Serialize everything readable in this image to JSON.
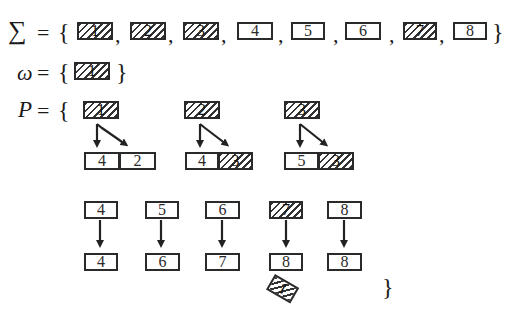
{
  "sigma_set": {
    "symbol": "∑",
    "equals": "=",
    "open_brace": "{",
    "close_brace": "}",
    "tiles": [
      {
        "label": "1",
        "hatched": true
      },
      {
        "label": "2",
        "hatched": true
      },
      {
        "label": "3",
        "hatched": true
      },
      {
        "label": "4",
        "hatched": false
      },
      {
        "label": "5",
        "hatched": false
      },
      {
        "label": "6",
        "hatched": false
      },
      {
        "label": "7",
        "hatched": true
      },
      {
        "label": "8",
        "hatched": false
      }
    ]
  },
  "omega_set": {
    "symbol": "ω",
    "equals": "=",
    "open_brace": "{",
    "close_brace": "}",
    "tiles": [
      {
        "label": "1",
        "hatched": true
      }
    ]
  },
  "productions": {
    "symbol": "P",
    "equals": "=",
    "open_brace": "{",
    "close_brace": "}",
    "rules": [
      {
        "lhs": {
          "label": "1",
          "hatched": true
        },
        "rhs": [
          {
            "label": "4",
            "hatched": false
          },
          {
            "label": "2",
            "hatched": false
          }
        ]
      },
      {
        "lhs": {
          "label": "2",
          "hatched": true
        },
        "rhs": [
          {
            "label": "4",
            "hatched": false
          },
          {
            "label": "3",
            "hatched": true
          }
        ]
      },
      {
        "lhs": {
          "label": "3",
          "hatched": true
        },
        "rhs": [
          {
            "label": "5",
            "hatched": false
          },
          {
            "label": "3",
            "hatched": true
          }
        ]
      },
      {
        "lhs": {
          "label": "4",
          "hatched": false
        },
        "rhs": [
          {
            "label": "4",
            "hatched": false
          }
        ]
      },
      {
        "lhs": {
          "label": "5",
          "hatched": false
        },
        "rhs": [
          {
            "label": "6",
            "hatched": false
          }
        ]
      },
      {
        "lhs": {
          "label": "6",
          "hatched": false
        },
        "rhs": [
          {
            "label": "7",
            "hatched": false
          }
        ]
      },
      {
        "lhs": {
          "label": "7",
          "hatched": true
        },
        "rhs": [
          {
            "label": "8",
            "hatched": false
          },
          {
            "label": "1",
            "hatched": true,
            "rotated": true
          }
        ]
      },
      {
        "lhs": {
          "label": "8",
          "hatched": false
        },
        "rhs": [
          {
            "label": "8",
            "hatched": false
          }
        ]
      }
    ]
  },
  "separator": ","
}
